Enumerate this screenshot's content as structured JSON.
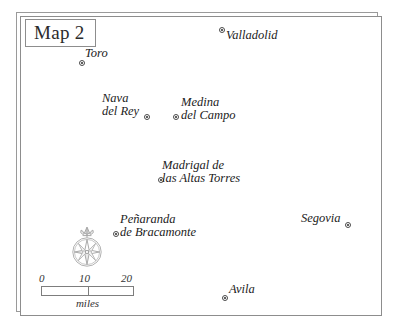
{
  "map": {
    "title": "Map 2",
    "cities": [
      {
        "name": "Valladolid",
        "lines": [
          "Valladolid"
        ],
        "marker_x": 219,
        "marker_y": 27,
        "label_x": 226,
        "label_y": 29
      },
      {
        "name": "Toro",
        "lines": [
          "Toro"
        ],
        "marker_x": 79,
        "marker_y": 60,
        "label_x": 85,
        "label_y": 47
      },
      {
        "name": "Nava del Rey",
        "lines": [
          "Nava",
          "del Rey"
        ],
        "marker_x": 144,
        "marker_y": 114,
        "label_x": 102,
        "label_y": 92
      },
      {
        "name": "Medina del Campo",
        "lines": [
          "Medina",
          "del Campo"
        ],
        "marker_x": 173,
        "marker_y": 114,
        "label_x": 181,
        "label_y": 96
      },
      {
        "name": "Madrigal de las Altas Torres",
        "lines": [
          "Madrigal de",
          "las Altas Torres"
        ],
        "marker_x": 158,
        "marker_y": 177,
        "label_x": 162,
        "label_y": 159
      },
      {
        "name": "Penaranda de Bracamonte",
        "lines": [
          "Peñaranda",
          "de Bracamonte"
        ],
        "marker_x": 113,
        "marker_y": 231,
        "label_x": 120,
        "label_y": 213
      },
      {
        "name": "Segovia",
        "lines": [
          "Segovia"
        ],
        "marker_x": 345,
        "marker_y": 222,
        "label_x": 301,
        "label_y": 212
      },
      {
        "name": "Avila",
        "lines": [
          "Avila"
        ],
        "marker_x": 222,
        "marker_y": 295,
        "label_x": 229,
        "label_y": 283
      }
    ],
    "compass": {
      "icon": "compass-rose-icon",
      "north_label": "N"
    },
    "scale": {
      "ticks": [
        "0",
        "10",
        "20"
      ],
      "unit": "miles"
    },
    "colors": {
      "frame": "#8d8d8d",
      "text": "#222222",
      "marker": "#2a2a2a",
      "background": "#ffffff"
    }
  }
}
